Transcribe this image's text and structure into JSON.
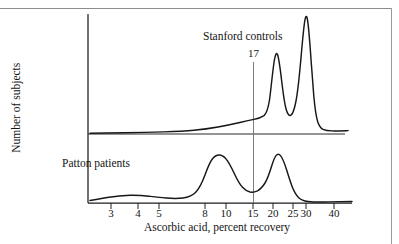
{
  "figure": {
    "axes": {
      "ylabel": "Number of subjects",
      "xlabel": "Ascorbic acid, percent recovery",
      "xscale": "log",
      "xticks": [
        3,
        4,
        5,
        8,
        10,
        15,
        20,
        25,
        30,
        40
      ],
      "xtick_labels": [
        "3",
        "4",
        "5",
        "8",
        "10",
        "15",
        "20",
        "25",
        "30",
        "40"
      ],
      "xlim": [
        2.3,
        45
      ],
      "grid": false
    },
    "annotations": {
      "upper_series_label": "Stanford controls",
      "lower_series_label": "Patton patients",
      "reference_line_label": "17",
      "reference_line_value": 17
    },
    "colors": {
      "ink": "#171717",
      "axis": "#1d1d1d",
      "reference_line": "#6f6f6f",
      "page_rule": "#8d8d8d",
      "background": "#ffffff"
    }
  },
  "chart_data": {
    "type": "line",
    "title": "",
    "subtitle": "",
    "xlabel": "Ascorbic acid, percent recovery",
    "ylabel": "Number of subjects",
    "xscale": "log",
    "xlim": [
      2.3,
      45
    ],
    "grid": false,
    "legend_position": "inline-annotation",
    "annotations": [
      {
        "text": "Stanford controls",
        "x": 17.0,
        "panel": "upper"
      },
      {
        "text": "Patton patients",
        "x": 4.6,
        "panel": "lower"
      },
      {
        "text": "17",
        "x": 17,
        "type": "reference-line",
        "spans": "both-panels"
      }
    ],
    "series": [
      {
        "name": "Stanford controls",
        "panel": "upper",
        "description": "Smoothed frequency distribution, bimodal with sharp peaks near 21 and 27 percent recovery",
        "x": [
          2.4,
          3,
          4,
          5,
          6,
          7,
          8,
          9,
          10,
          11,
          12,
          13,
          14,
          15,
          16,
          17,
          18,
          19,
          20,
          20.5,
          21,
          21.5,
          22,
          23,
          23.5,
          24,
          25,
          26,
          26.5,
          27,
          27.5,
          28,
          29,
          30,
          32,
          35,
          40,
          44
        ],
        "values": [
          1,
          1,
          1,
          1,
          1,
          1.5,
          2,
          2.5,
          3,
          4,
          5,
          6,
          7.5,
          9,
          11,
          13,
          16,
          22,
          38,
          56,
          64,
          58,
          42,
          28,
          26,
          30,
          46,
          76,
          92,
          99,
          84,
          46,
          16,
          10,
          8,
          8,
          8,
          8
        ],
        "peaks": [
          {
            "x": 21,
            "height": 64
          },
          {
            "x": 27,
            "height": 99
          }
        ],
        "local_minimum": {
          "x": 23.5,
          "height": 26
        }
      },
      {
        "name": "Patton patients",
        "panel": "lower",
        "description": "Smoothed frequency distribution, bimodal with broad peaks near 9.5 and 20 percent recovery",
        "x": [
          2.4,
          3,
          3.5,
          4,
          4.5,
          5,
          6,
          7,
          7.5,
          8,
          8.5,
          9,
          9.5,
          10,
          11,
          12,
          13,
          14,
          15,
          16,
          17,
          18,
          19,
          20,
          21,
          22,
          23,
          24,
          25,
          27,
          30,
          35,
          40,
          44
        ],
        "values": [
          2,
          5,
          7,
          8,
          7.5,
          6.5,
          5,
          7,
          12,
          26,
          44,
          56,
          60,
          57,
          44,
          32,
          26,
          25,
          27,
          32,
          40,
          50,
          58,
          61,
          55,
          42,
          28,
          18,
          11,
          6,
          4,
          3,
          3,
          2.5
        ],
        "peaks": [
          {
            "x": 9.5,
            "height": 60
          },
          {
            "x": 20,
            "height": 61
          }
        ],
        "local_minimum": {
          "x": 14,
          "height": 25
        }
      }
    ]
  }
}
